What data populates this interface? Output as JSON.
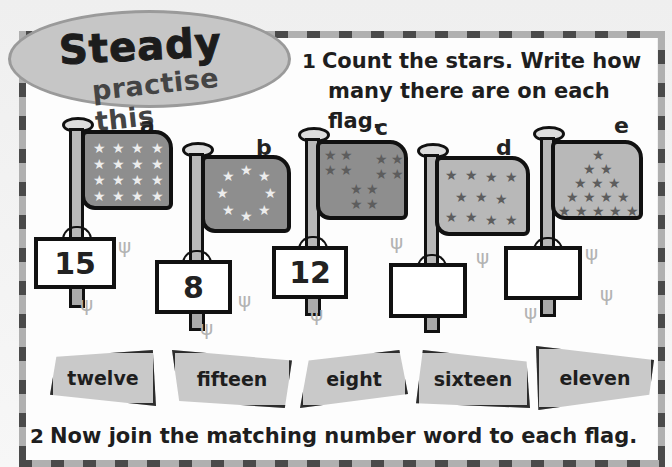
{
  "badge": {
    "title": "Steady",
    "subtitle": "practise this"
  },
  "question1": {
    "number": "1",
    "line1": "Count the stars. Write how",
    "line2": "many there are on each flag."
  },
  "flags": [
    {
      "letter": "a",
      "stars": 16,
      "star_layout": "4x4 grid",
      "answer_written": "15"
    },
    {
      "letter": "b",
      "stars": 8,
      "star_layout": "circle",
      "answer_written": "8"
    },
    {
      "letter": "c",
      "stars": 12,
      "star_layout": "three groups of four",
      "answer_written": "12"
    },
    {
      "letter": "d",
      "stars": 11,
      "star_layout": "rows 4-3-4",
      "answer_written": ""
    },
    {
      "letter": "e",
      "stars": 15,
      "star_layout": "triangle 1-2-3-4-5",
      "answer_written": ""
    }
  ],
  "number_words": [
    "twelve",
    "fifteen",
    "eight",
    "sixteen",
    "eleven"
  ],
  "question2": {
    "number": "2",
    "text": "Now join the matching number word to each flag."
  },
  "icons": {
    "star": "★",
    "grass": "ψ"
  },
  "colors": {
    "dark_flag": "#8e8e8e",
    "light_flag": "#b8b8b8",
    "badge": "#c6c6c6",
    "card": "#c9c9c9",
    "border_dark": "#4a4a4a",
    "border_light": "#b0b0b0"
  }
}
